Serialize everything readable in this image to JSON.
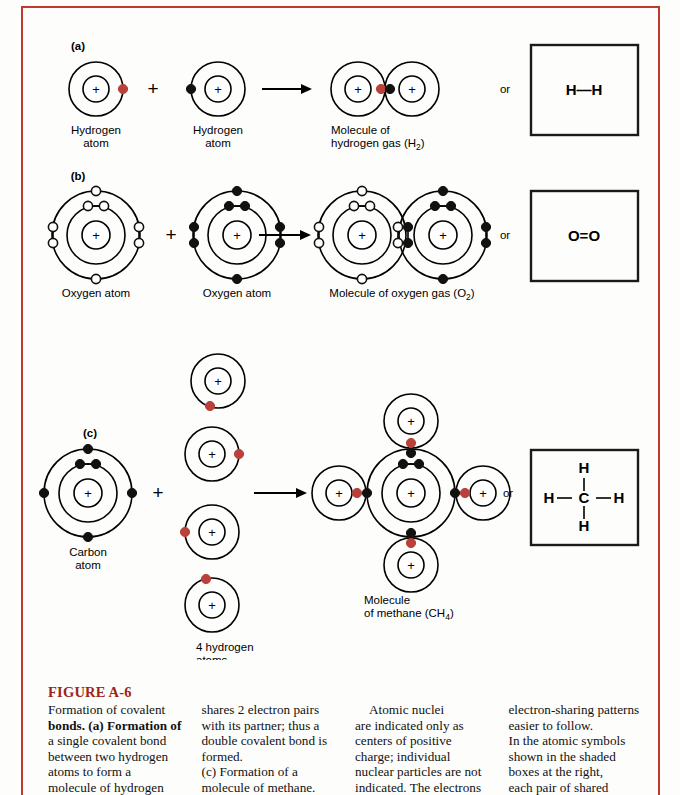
{
  "frame": {
    "rule_color": "#c0392f"
  },
  "figure": {
    "rows": [
      {
        "id": "a",
        "panel_label": "(a)",
        "reactant1_label_line1": "Hydrogen",
        "reactant1_label_line2": "atom",
        "reactant2_label_line1": "Hydrogen",
        "reactant2_label_line2": "atom",
        "product_label_line1": "Molecule of",
        "product_label_line2": "hydrogen gas (H",
        "product_label_sub": "2",
        "product_label_tail": ")",
        "or_label": "or",
        "symbol": "H—H",
        "symbol_left": "H",
        "symbol_right": "H",
        "plus_sign": "+"
      },
      {
        "id": "b",
        "panel_label": "(b)",
        "reactant1_label": "Oxygen atom",
        "reactant2_label": "Oxygen atom",
        "product_label": "Molecule of oxygen gas (O",
        "product_label_sub": "2",
        "product_label_tail": ")",
        "or_label": "or",
        "symbol_left": "O",
        "symbol_right": "O",
        "plus_sign": "+"
      },
      {
        "id": "c",
        "panel_label": "(c)",
        "reactant1_label_line1": "Carbon",
        "reactant1_label_line2": "atom",
        "reactant2_label_line1": "4 hydrogen",
        "reactant2_label_line2": "atoms",
        "product_label_line1": "Molecule",
        "product_label_line2": "of methane (CH",
        "product_label_sub": "4",
        "product_label_tail": ")",
        "or_label": "or",
        "symbol_center": "C",
        "symbol_top": "H",
        "symbol_bottom": "H",
        "symbol_left": "H",
        "symbol_right": "H",
        "plus_sign": "+"
      }
    ],
    "nucleus_glyph": "+"
  },
  "caption": {
    "heading": "FIGURE A-6",
    "columns": [
      {
        "lines": [
          "Formation of covalent",
          "bonds. (a) Formation of",
          "a single covalent bond",
          "between two hydrogen",
          "atoms to form a",
          "molecule of hydrogen"
        ]
      },
      {
        "lines": [
          "shares 2 electron pairs",
          "with its partner; thus a",
          "double covalent bond is",
          "formed.",
          "(c) Formation of a",
          "molecule of methane."
        ]
      },
      {
        "lines": [
          "    Atomic nuclei",
          "are indicated only as",
          "centers of positive",
          "charge; individual",
          "nuclear particles are not",
          "indicated. The electrons"
        ]
      },
      {
        "lines": [
          "electron-sharing patterns",
          "easier to follow.",
          "In the atomic symbols",
          "shown in the shaded",
          "boxes at the right,",
          "each pair of shared"
        ]
      }
    ]
  },
  "colors": {
    "electron_red": "#b8413a",
    "electron_black": "#111111",
    "electron_white": "#ffffff",
    "heading_red": "#9b2620",
    "stroke": "#000000"
  }
}
